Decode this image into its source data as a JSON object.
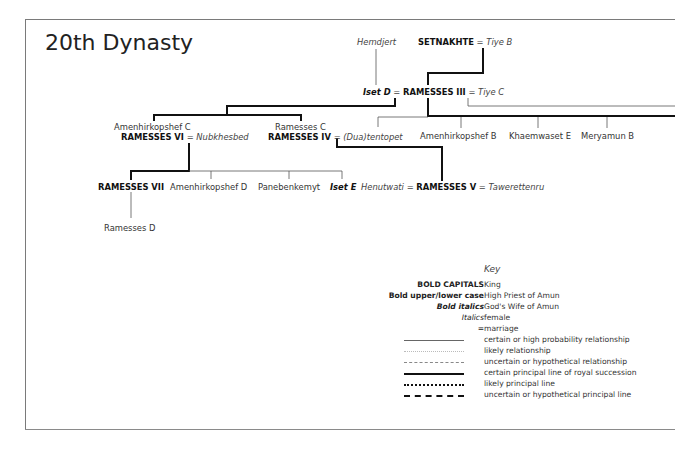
{
  "title": "20th Dynasty",
  "tree": {
    "row1": {
      "hemdjert": "Hemdjert",
      "setnakhte": "SETNAKHTE",
      "eq": "=",
      "tiye_b": "Tiye B"
    },
    "row2": {
      "iset_d": "Iset D",
      "eq1": "=",
      "ramesses_iii": "RAMESSES III",
      "eq2": "=",
      "tiye_c": "Tiye C"
    },
    "row3": {
      "amenhirkopshef_c": "Amenhirkopshef C",
      "ramesses_vi": "RAMESSES VI",
      "eq1": "=",
      "nubkhesbed": "Nubkhesbed",
      "ramesses_c": "Ramesses C",
      "ramesses_iv": "RAMESSES IV",
      "eq2": "=",
      "duatentopet": "(Dua)tentopet",
      "amenhirkopshef_b": "Amenhirkopshef B",
      "khaemwaset_e": "Khaemwaset E",
      "meryamun_b": "Meryamun B"
    },
    "row4": {
      "ramesses_vii": "RAMESSES VII",
      "amenhirkopshef_d": "Amenhirkopshef D",
      "panebenkemyt": "Panebenkemyt",
      "iset_e": "Iset E",
      "henutwati": "Henutwati",
      "eq1": "=",
      "ramesses_v": "RAMESSES V",
      "eq2": "=",
      "tawerettenru": "Tawerettenru"
    },
    "row5": {
      "ramesses_d": "Ramesses D"
    }
  },
  "key": {
    "title": "Key",
    "rows": [
      {
        "left": "BOLD CAPITALS",
        "right": "King"
      },
      {
        "left": "Bold upper/lower case",
        "right": "High Priest of Amun"
      },
      {
        "left": "Bold italics",
        "right": "God's Wife of Amun"
      },
      {
        "left": "Italics",
        "right": "female"
      },
      {
        "left": "=",
        "right": "marriage"
      },
      {
        "left": "",
        "right": "certain or high probability relationship"
      },
      {
        "left": "",
        "right": "likely relationship"
      },
      {
        "left": "",
        "right": "uncertain or hypothetical relationship"
      },
      {
        "left": "",
        "right": "certain principal line of royal succession"
      },
      {
        "left": "",
        "right": "likely principal line"
      },
      {
        "left": "",
        "right": "uncertain or hypothetical principal line"
      }
    ]
  },
  "colors": {
    "line": "#222222",
    "thin_line": "#555555",
    "frame": "#7a7a7a"
  }
}
